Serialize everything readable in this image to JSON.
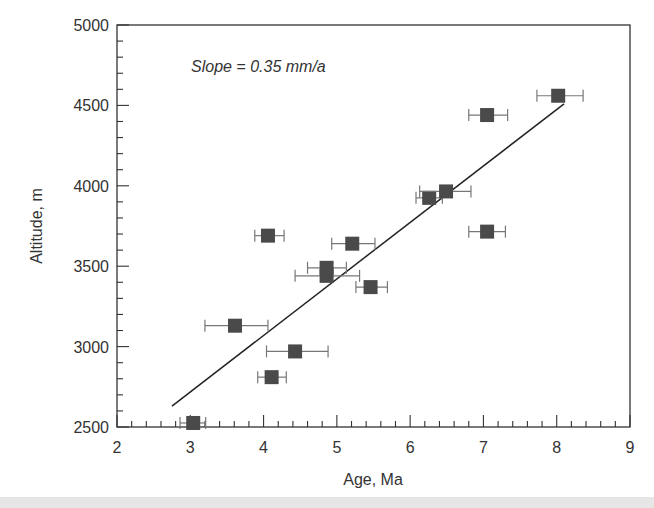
{
  "chart_data": {
    "type": "scatter",
    "title": "",
    "xlabel": "Age, Ma",
    "ylabel": "Altitude, m",
    "xlim": [
      2,
      9
    ],
    "ylim": [
      2500,
      5000
    ],
    "xticks": [
      2,
      3,
      4,
      5,
      6,
      7,
      8,
      9
    ],
    "yticks": [
      2500,
      3000,
      3500,
      4000,
      4500,
      5000
    ],
    "grid": false,
    "legend": null,
    "annotation": "Slope = 0.35 mm/a",
    "series": [
      {
        "name": "samples",
        "marker": "square",
        "color": "#4a4a4a",
        "points": [
          {
            "x": 3.04,
            "y": 2525,
            "xerr_low": 2.86,
            "xerr_high": 3.21
          },
          {
            "x": 3.61,
            "y": 3130,
            "xerr_low": 3.2,
            "xerr_high": 4.06
          },
          {
            "x": 4.11,
            "y": 2810,
            "xerr_low": 3.92,
            "xerr_high": 4.31
          },
          {
            "x": 4.06,
            "y": 3690,
            "xerr_low": 3.88,
            "xerr_high": 4.28
          },
          {
            "x": 4.43,
            "y": 2970,
            "xerr_low": 4.04,
            "xerr_high": 4.88
          },
          {
            "x": 4.86,
            "y": 3490,
            "xerr_low": 4.6,
            "xerr_high": 5.13
          },
          {
            "x": 4.86,
            "y": 3440,
            "xerr_low": 4.43,
            "xerr_high": 5.31
          },
          {
            "x": 5.21,
            "y": 3640,
            "xerr_low": 4.93,
            "xerr_high": 5.52
          },
          {
            "x": 5.46,
            "y": 3370,
            "xerr_low": 5.26,
            "xerr_high": 5.69
          },
          {
            "x": 6.26,
            "y": 3925,
            "xerr_low": 6.08,
            "xerr_high": 6.44
          },
          {
            "x": 6.49,
            "y": 3965,
            "xerr_low": 6.13,
            "xerr_high": 6.83
          },
          {
            "x": 7.05,
            "y": 4440,
            "xerr_low": 6.8,
            "xerr_high": 7.33
          },
          {
            "x": 7.05,
            "y": 3715,
            "xerr_low": 6.8,
            "xerr_high": 7.3
          },
          {
            "x": 8.02,
            "y": 4560,
            "xerr_low": 7.73,
            "xerr_high": 8.36
          }
        ]
      }
    ],
    "fit_line": {
      "x": [
        2.75,
        8.1
      ],
      "y": [
        2630,
        4510
      ],
      "slope_label": "0.35 mm/a"
    }
  }
}
